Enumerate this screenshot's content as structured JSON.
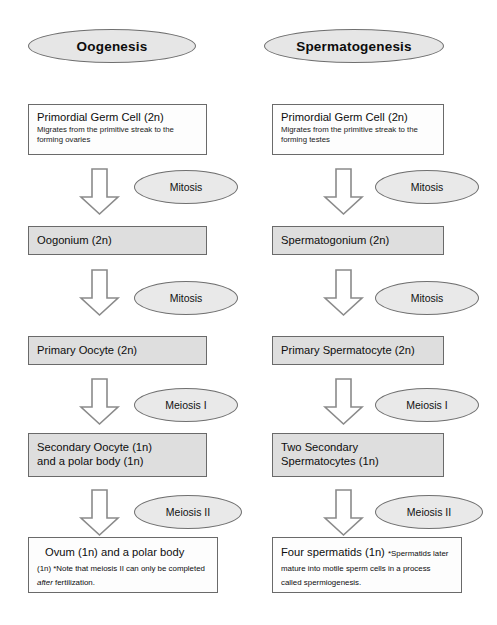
{
  "diagram": {
    "type": "flowchart",
    "columns": [
      {
        "id": "oogenesis",
        "title": "Oogenesis",
        "steps": [
          {
            "title": "Primordial Germ Cell (2n)",
            "subtitle": "Migrates from the primitive streak to the forming ovaries",
            "fill": "white"
          },
          {
            "title": "Oogonium (2n)",
            "subtitle": "",
            "fill": "gray"
          },
          {
            "title": "Primary Oocyte (2n)",
            "subtitle": "",
            "fill": "gray"
          },
          {
            "title": "Secondary Oocyte (1n)\nand a polar body (1n)",
            "subtitle": "",
            "fill": "gray"
          },
          {
            "title": "Ovum (1n) and a polar body",
            "subtitle_parts": [
              "(1n) *Note that meiosis II can only be completed ",
              "after",
              " fertilization."
            ],
            "fill": "white"
          }
        ],
        "transitions": [
          "Mitosis",
          "Mitosis",
          "Meiosis I",
          "Meiosis II"
        ]
      },
      {
        "id": "spermatogenesis",
        "title": "Spermatogenesis",
        "steps": [
          {
            "title": "Primordial Germ Cell (2n)",
            "subtitle": "Migrates from the primitive streak to the forming testes",
            "fill": "white"
          },
          {
            "title": "Spermatogonium (2n)",
            "subtitle": "",
            "fill": "gray"
          },
          {
            "title": "Primary Spermatocyte (2n)",
            "subtitle": "",
            "fill": "gray"
          },
          {
            "title": "Two Secondary\nSpermatocytes (1n)",
            "subtitle": "",
            "fill": "gray"
          },
          {
            "title": "Four spermatids (1n) ",
            "subtitle_parts": [
              "*Spermatids later mature into motile sperm cells in a process called spermiogenesis.",
              "",
              ""
            ],
            "fill": "white"
          }
        ],
        "transitions": [
          "Mitosis",
          "Mitosis",
          "Meiosis I",
          "Meiosis II"
        ]
      }
    ],
    "colors": {
      "box_outline": "#6a6a6a",
      "box_fill_gray": "#dedede",
      "box_fill_white": "#fdfdfd",
      "ellipse_fill": "#e6e6e6",
      "ellipse_outline": "#6f6f6f",
      "arrow_fill": "#ffffff",
      "arrow_outline": "#8a8a8a",
      "text": "#0d0d0d",
      "background": "#ffffff"
    }
  }
}
